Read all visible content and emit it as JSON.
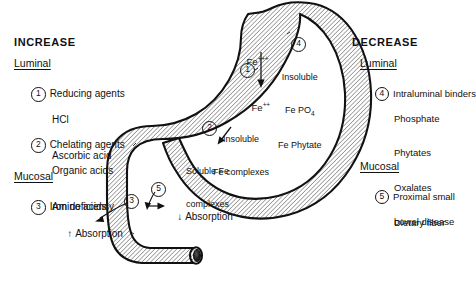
{
  "figure": {
    "organ_labels": {
      "ferric": "Fe",
      "ferric_charge": "+++",
      "ferrous": "Fe",
      "ferrous_charge": "++",
      "insoluble_salts_line1": "Insoluble",
      "insoluble_salts_line2": "Fe PO",
      "insoluble_salts_sub": "4",
      "insoluble_salts_line3": "Fe Phytate",
      "insoluble_complexes_line1": "Insoluble",
      "insoluble_complexes_line2": "Fe complexes",
      "soluble_complexes_line1": "Soluble Fe",
      "soluble_complexes_line2": "complexes",
      "absorption_increase": "Absorption",
      "absorption_increase_arrow": "↑",
      "absorption_decrease": "Absorption",
      "absorption_decrease_arrow": "↓"
    },
    "callouts": {
      "one": "1",
      "two": "2",
      "three": "3",
      "four": "4",
      "five": "5"
    }
  },
  "increase": {
    "heading": "INCREASE",
    "sections": [
      {
        "name": "Luminal",
        "entries": [
          {
            "number": "1",
            "label": "Reducing agents",
            "sublabels": [
              "HCl",
              "Ascorbic acid"
            ]
          },
          {
            "number": "2",
            "label": "Chelating agents",
            "sublabels": [
              "Organic acids",
              "Amino acids"
            ]
          }
        ]
      },
      {
        "name": "Mucosal",
        "entries": [
          {
            "number": "3",
            "label": "Iron deficiency",
            "sublabels": []
          }
        ]
      }
    ]
  },
  "decrease": {
    "heading": "DECREASE",
    "sections": [
      {
        "name": "Luminal",
        "entries": [
          {
            "number": "4",
            "label": "Intraluminal binders",
            "sublabels": [
              "Phosphate",
              "Phytates",
              "Oxalates",
              "Dietary fiber"
            ]
          }
        ]
      },
      {
        "name": "Mucosal",
        "entries": [
          {
            "number": "5",
            "label": "Proximal small",
            "sublabels": [
              "bowel disease"
            ]
          }
        ]
      }
    ]
  },
  "colors": {
    "ink": "#111111",
    "paper": "#ffffff",
    "hatch": "#3a3a3a",
    "lumen": "#1a1a1a"
  }
}
